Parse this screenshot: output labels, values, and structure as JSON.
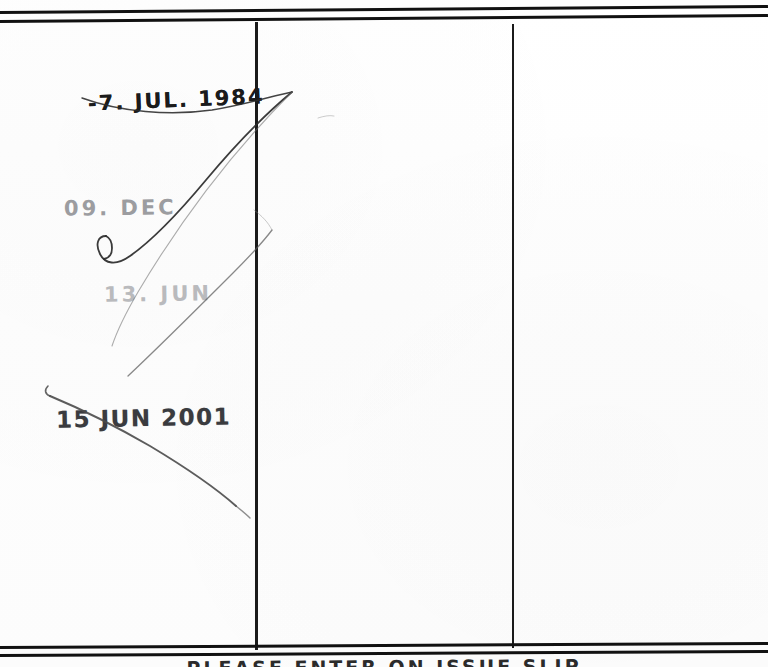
{
  "document": {
    "kind": "library-date-due-slip",
    "footer_note": "PLEASE  ENTER   ON  ISSUE  SLIP"
  },
  "stamps": [
    {
      "id": "stamp-1",
      "text": "-7. JUL. 1984",
      "day": "-7",
      "month": "JUL",
      "year": "1984",
      "ink": "dark"
    },
    {
      "id": "stamp-2",
      "text": "09.  DEC",
      "day": "09",
      "month": "DEC",
      "year": "",
      "ink": "faded"
    },
    {
      "id": "stamp-3",
      "text": "13.  JUN",
      "day": "13",
      "month": "JUN",
      "year": "",
      "ink": "very-faded"
    },
    {
      "id": "stamp-4",
      "text": "15 JUN 2001",
      "day": "15",
      "month": "JUN",
      "year": "2001",
      "ink": "dark"
    }
  ],
  "annotations": {
    "pen_stroke_upper": "cancellation-stroke",
    "pen_stroke_lower": "cancellation-stroke"
  },
  "rules": {
    "top_border": "double-rule",
    "bottom_border": "double-rule",
    "column_divider_1": "vertical-rule",
    "column_divider_2": "vertical-rule"
  },
  "colors": {
    "ink_dark": "#1b1b1b",
    "ink_faded": "#8f9094",
    "rule": "#111111",
    "paper": "#fefefe"
  }
}
